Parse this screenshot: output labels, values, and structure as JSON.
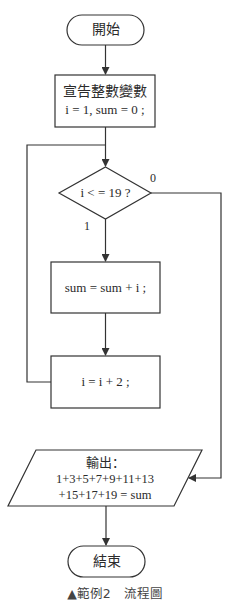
{
  "flowchart": {
    "start": {
      "label": "開始"
    },
    "declare": {
      "line1": "宣告整數變數",
      "line2": "i = 1, sum = 0 ;"
    },
    "decision": {
      "label": "i < = 19 ?",
      "false_label": "0",
      "true_label": "1"
    },
    "accumulate": {
      "label": "sum = sum + i ;"
    },
    "increment": {
      "label": "i = i + 2 ;"
    },
    "output": {
      "line1": "輸出：",
      "line2": "1+3+5+7+9+11+13",
      "line3": "+15+17+19 = sum"
    },
    "end": {
      "label": "結束"
    }
  },
  "caption": {
    "marker": "▲",
    "text": "範例2　流程圖"
  },
  "colors": {
    "stroke": "#333333",
    "text": "#2b2b2b",
    "background": "#ffffff"
  }
}
